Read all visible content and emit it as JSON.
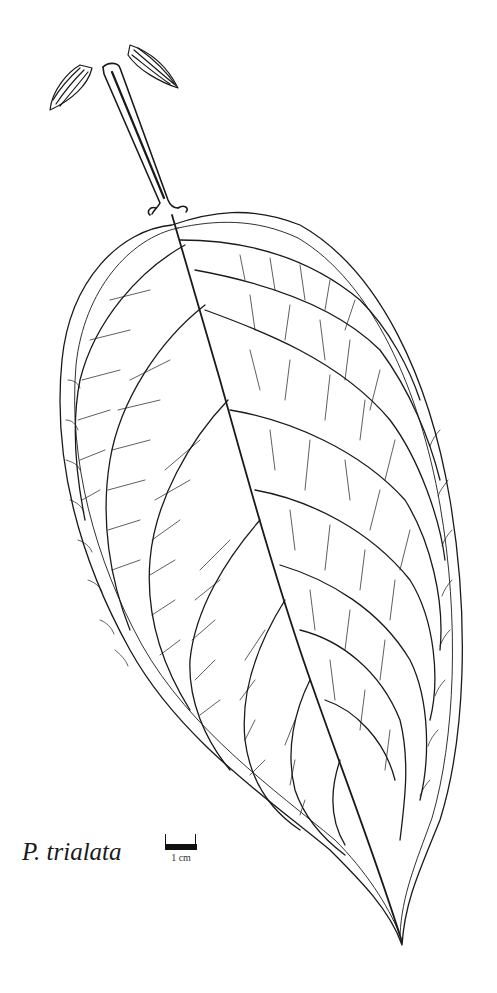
{
  "figure": {
    "species_label": "P. trialata",
    "scale_bar": {
      "label": "1 cm"
    },
    "colors": {
      "ink": "#1a1a1a",
      "background": "#ffffff"
    }
  }
}
